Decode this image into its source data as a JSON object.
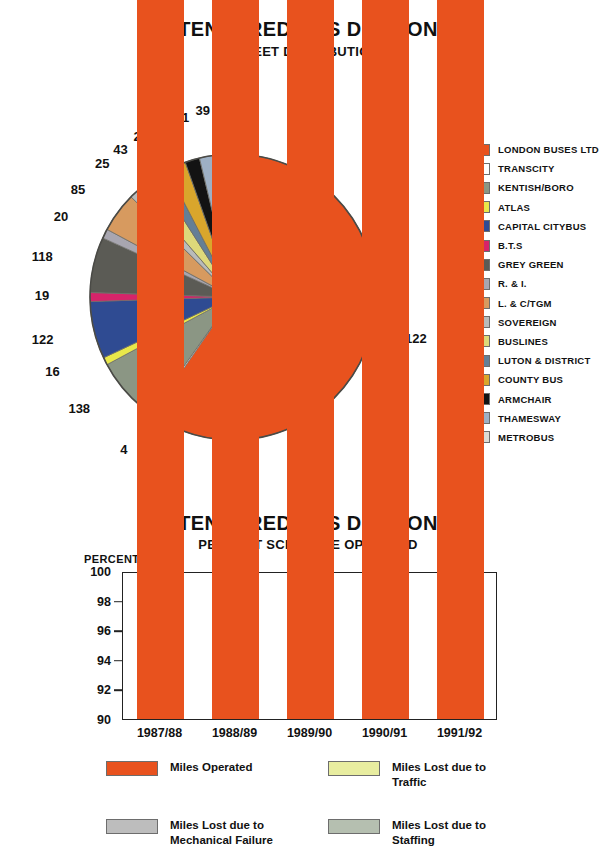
{
  "page": {
    "background": "#ffffff"
  },
  "pie_chart": {
    "title": "TENDERED BUS DIVISION",
    "subtitle": "FLEET DISTRIBUTION",
    "legend": [
      {
        "label": "LONDON BUSES LTD",
        "color": "#e8521e"
      },
      {
        "label": "TRANSCITY",
        "color": "#ffffff"
      },
      {
        "label": "KENTISH/BORO",
        "color": "#8b9684"
      },
      {
        "label": "ATLAS",
        "color": "#e9e84a"
      },
      {
        "label": "CAPITAL CITYBUS",
        "color": "#2f4b92"
      },
      {
        "label": "B.T.S",
        "color": "#d6246a"
      },
      {
        "label": "GREY GREEN",
        "color": "#5b5b55"
      },
      {
        "label": "R. & I.",
        "color": "#a8a6b0"
      },
      {
        "label": "L. & C/TGM",
        "color": "#d79a5f"
      },
      {
        "label": "SOVEREIGN",
        "color": "#b9bbba"
      },
      {
        "label": "BUSLINES",
        "color": "#ddd97a"
      },
      {
        "label": "LUTON & DISTRICT",
        "color": "#647f96"
      },
      {
        "label": "COUNTY BUS",
        "color": "#d9a62c"
      },
      {
        "label": "ARMCHAIR",
        "color": "#131313"
      },
      {
        "label": "THAMESWAY",
        "color": "#9eb0c4"
      },
      {
        "label": "METROBUS",
        "color": "#dcdcd6"
      }
    ]
  },
  "bar_chart": {
    "title": "TENDERED BUS DIVISION",
    "subtitle": "PERCENT SCHEDULE OPERATED",
    "axis_caption": "PERCENT",
    "legend": [
      {
        "label": "Miles Operated",
        "color": "#e8521e"
      },
      {
        "label": "Miles Lost due to Traffic",
        "color": "#e8eda0"
      },
      {
        "label": "Miles Lost due to Mechanical Failure",
        "color": "#bdbdbd"
      },
      {
        "label": "Miles Lost due to Staffing",
        "color": "#b5bfb0"
      }
    ]
  },
  "chart_data": [
    {
      "type": "pie",
      "title": "TENDERED BUS DIVISION",
      "subtitle": "FLEET DISTRIBUTION",
      "unit": "vehicles",
      "total": 1978,
      "legend_position": "right",
      "labels": [
        "LONDON BUSES LTD",
        "TRANSCITY",
        "KENTISH/BORO",
        "ATLAS",
        "CAPITAL CITYBUS",
        "B.T.S",
        "GREY GREEN",
        "R. & I.",
        "L. & C/TGM",
        "SOVEREIGN",
        "BUSLINES",
        "LUTON & DISTRICT",
        "COUNTY BUS",
        "ARMCHAIR",
        "THAMESWAY",
        "METROBUS"
      ],
      "values": [
        1122,
        4,
        138,
        16,
        122,
        19,
        118,
        20,
        85,
        25,
        43,
        27,
        41,
        31,
        39,
        32
      ],
      "colors": [
        "#e8521e",
        "#ffffff",
        "#8b9684",
        "#e9e84a",
        "#2f4b92",
        "#d6246a",
        "#5b5b55",
        "#a8a6b0",
        "#d79a5f",
        "#b9bbba",
        "#ddd97a",
        "#647f96",
        "#d9a62c",
        "#131313",
        "#9eb0c4",
        "#dcdcd6"
      ],
      "data_labels": [
        "1122",
        "4",
        "138",
        "16",
        "122",
        "19",
        "118",
        "20",
        "85",
        "25",
        "43",
        "27",
        "41",
        "31",
        "39",
        "32"
      ]
    },
    {
      "type": "bar",
      "subtype": "stacked",
      "title": "TENDERED BUS DIVISION",
      "subtitle": "PERCENT SCHEDULE OPERATED",
      "ylabel": "PERCENT",
      "xlabel": "",
      "ylim": [
        90,
        100
      ],
      "yticks": [
        90,
        92,
        94,
        96,
        98,
        100
      ],
      "grid": false,
      "legend_position": "bottom",
      "categories": [
        "1987/88",
        "1988/89",
        "1989/90",
        "1990/91",
        "1991/92"
      ],
      "series": [
        {
          "name": "Miles Operated",
          "color": "#e8521e",
          "values": [
            93.5,
            96.0,
            95.9,
            97.3,
            98.1
          ]
        },
        {
          "name": "Miles Lost due to Mechanical Failure",
          "color": "#bdbdbd",
          "values": [
            1.3,
            0.8,
            0.9,
            0.6,
            0.5
          ]
        },
        {
          "name": "Miles Lost due to Traffic",
          "color": "#e8eda0",
          "values": [
            1.5,
            1.2,
            1.2,
            1.0,
            0.8
          ]
        },
        {
          "name": "Miles Lost due to Staffing",
          "color": "#b5bfb0",
          "values": [
            3.7,
            2.0,
            2.0,
            1.1,
            0.6
          ]
        }
      ]
    }
  ]
}
